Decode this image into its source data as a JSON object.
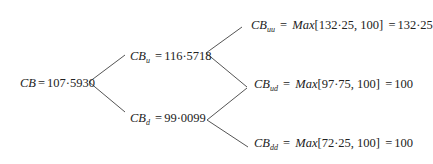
{
  "diagram": {
    "type": "binomial-tree",
    "line_color": "#555555",
    "nodes": {
      "root": {
        "var": "CB",
        "sub": "",
        "eq": "=",
        "value": "107·5930"
      },
      "u": {
        "var": "CB",
        "sub": "u",
        "eq": "=",
        "value": "116·5718"
      },
      "d": {
        "var": "CB",
        "sub": "d",
        "eq": "=",
        "value": "99·0099"
      },
      "uu": {
        "var": "CB",
        "sub": "uu",
        "eq": "=",
        "fn": "Max",
        "args": "[132·25, 100]",
        "eq2": "=",
        "value": "132·25"
      },
      "ud": {
        "var": "CB",
        "sub": "ud",
        "eq": "=",
        "fn": "Max",
        "args": "[97·75, 100]",
        "eq2": "=",
        "value": "100"
      },
      "dd": {
        "var": "CB",
        "sub": "dd",
        "eq": "=",
        "fn": "Max",
        "args": "[72·25, 100]",
        "eq2": "=",
        "value": "100"
      }
    }
  }
}
